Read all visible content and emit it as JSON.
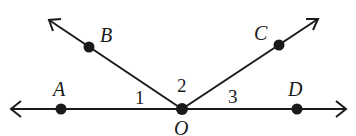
{
  "diagram": {
    "type": "geometry-angles",
    "stroke_color": "#1a1a1a",
    "points": {
      "A": {
        "label": "A",
        "x": 61,
        "y": 109
      },
      "B": {
        "label": "B",
        "x": 89,
        "y": 47
      },
      "O": {
        "label": "O",
        "x": 182,
        "y": 109
      },
      "C": {
        "label": "C",
        "x": 279,
        "y": 45
      },
      "D": {
        "label": "D",
        "x": 297,
        "y": 109
      }
    },
    "angles": {
      "angle1": {
        "label": "1",
        "between": "OA-OB"
      },
      "angle2": {
        "label": "2",
        "between": "OB-OC"
      },
      "angle3": {
        "label": "3",
        "between": "OC-OD"
      }
    },
    "lines": [
      {
        "name": "line-AD",
        "from": "left-arrow",
        "to": "right-arrow",
        "through": [
          "A",
          "O",
          "D"
        ]
      },
      {
        "name": "ray-OB",
        "from": "O",
        "through": "B"
      },
      {
        "name": "ray-OC",
        "from": "O",
        "through": "C"
      }
    ]
  }
}
